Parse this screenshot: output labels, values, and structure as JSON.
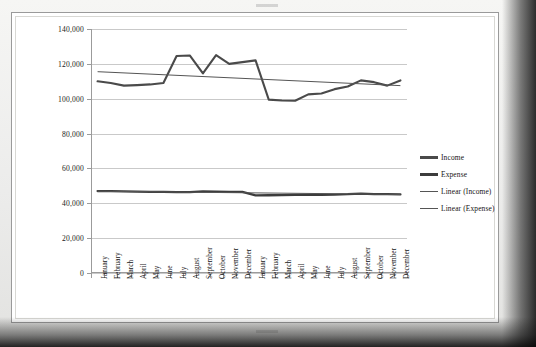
{
  "chart_data": {
    "type": "line",
    "title": "",
    "subtitle": "",
    "xlabel": "",
    "ylabel": "",
    "ylim": [
      0,
      140000
    ],
    "ytick_step": 20000,
    "ytick_labels": [
      "140,000",
      "120,000",
      "100,000",
      "80,000",
      "60,000",
      "40,000",
      "20,000",
      "0"
    ],
    "ytick_values": [
      140000,
      120000,
      100000,
      80000,
      60000,
      40000,
      20000,
      0
    ],
    "grid": true,
    "legend_position": "right",
    "categories": [
      "January",
      "February",
      "March",
      "April",
      "May",
      "June",
      "July",
      "August",
      "September",
      "October",
      "November",
      "December",
      "January",
      "February",
      "March",
      "April",
      "May",
      "June",
      "July",
      "August",
      "September",
      "October",
      "November",
      "December"
    ],
    "series": [
      {
        "name": "Income",
        "color": "#4a4a4a",
        "width": 2.1,
        "values": [
          110000,
          109000,
          107500,
          107800,
          108200,
          109000,
          124500,
          124800,
          114500,
          125000,
          120000,
          121000,
          122000,
          99500,
          99000,
          98800,
          102500,
          103000,
          105500,
          107000,
          110500,
          109500,
          107500,
          110500
        ]
      },
      {
        "name": "Expense",
        "color": "#3c3c3c",
        "width": 2.3,
        "values": [
          47000,
          47000,
          46800,
          46700,
          46600,
          46500,
          46400,
          46400,
          46800,
          46700,
          46600,
          46500,
          44500,
          44600,
          44700,
          44800,
          44800,
          44900,
          45000,
          45200,
          45600,
          45300,
          45200,
          45100
        ]
      }
    ],
    "trendlines": [
      {
        "name": "Linear (Income)",
        "color": "#555555",
        "width": 1,
        "start_value": 115500,
        "end_value": 107500
      },
      {
        "name": "Linear (Expense)",
        "color": "#555555",
        "width": 1,
        "start_value": 46900,
        "end_value": 45100
      }
    ],
    "legend": [
      {
        "label": "Income",
        "style": "thick",
        "color": "#4a4a4a"
      },
      {
        "label": "Expense",
        "style": "thick",
        "color": "#3c3c3c"
      },
      {
        "label": "Linear (Income)",
        "style": "thin",
        "color": "#555555"
      },
      {
        "label": "Linear (Expense)",
        "style": "thin",
        "color": "#555555"
      }
    ]
  }
}
